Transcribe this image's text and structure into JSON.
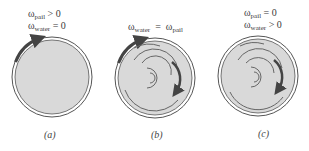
{
  "panels": [
    {
      "id": "a",
      "caption": "(a)",
      "lines": [
        {
          "symbol": "ω",
          "sub": "pail",
          "rel": "> 0"
        },
        {
          "symbol": "ω",
          "sub": "water",
          "rel": "= 0"
        }
      ]
    },
    {
      "id": "b",
      "caption": "(b)",
      "lines": [
        {
          "symbol": "ω",
          "sub": "water",
          "rel": "=",
          "symbol2": "ω",
          "sub2": "pail"
        }
      ]
    },
    {
      "id": "c",
      "caption": "(c)",
      "lines": [
        {
          "symbol": "ω",
          "sub": "pail",
          "rel": "= 0"
        },
        {
          "symbol": "ω",
          "sub": "water",
          "rel": "> 0"
        }
      ]
    }
  ],
  "colors": {
    "water": "#d9d9d9",
    "outline": "#555555",
    "arrow": "#444444",
    "swirl": "#666666"
  }
}
